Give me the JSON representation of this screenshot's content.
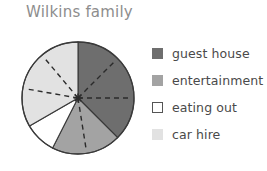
{
  "chart_title": "Wilkins family",
  "chart_data": {
    "type": "pie",
    "title": "Wilkins family",
    "xlabel": "",
    "ylabel": "",
    "legend_position": "right",
    "grid": false,
    "start_angle_deg": 0,
    "direction": "clockwise",
    "categories": [
      "guest house",
      "entertainment",
      "eating out",
      "car hire"
    ],
    "values": [
      37.5,
      20,
      9.2,
      33.3
    ],
    "units": "percent",
    "slices": [
      {
        "label": "guest house",
        "color": "#6e6e6e",
        "value": 37.5,
        "start_angle_deg": 0,
        "end_angle_deg": 135,
        "sweep_deg": 135,
        "divider_count": 2
      },
      {
        "label": "entertainment",
        "color": "#a3a3a3",
        "value": 20,
        "start_angle_deg": 135,
        "end_angle_deg": 207,
        "sweep_deg": 72,
        "divider_count": 1
      },
      {
        "label": "eating out",
        "color": "#ffffff",
        "value": 9.2,
        "start_angle_deg": 207,
        "end_angle_deg": 240,
        "sweep_deg": 33,
        "divider_count": 0
      },
      {
        "label": "car hire",
        "color": "#e2e2e2",
        "value": 33.3,
        "start_angle_deg": 240,
        "end_angle_deg": 360,
        "sweep_deg": 120,
        "divider_count": 2
      }
    ]
  },
  "colors": {
    "title_text": "#8d8d8d",
    "legend_text": "#4a4a4a",
    "outline": "#3a3a3a",
    "divider": "#2b2b2b",
    "background": "#ffffff"
  },
  "legend": {
    "items": [
      {
        "label": "guest house",
        "swatch_color": "#6e6e6e",
        "swatch_border": "#6e6e6e"
      },
      {
        "label": "entertainment",
        "swatch_color": "#a3a3a3",
        "swatch_border": "#a3a3a3"
      },
      {
        "label": "eating out",
        "swatch_color": "#ffffff",
        "swatch_border": "#555555"
      },
      {
        "label": "car hire",
        "swatch_color": "#e2e2e2",
        "swatch_border": "#e2e2e2"
      }
    ]
  }
}
